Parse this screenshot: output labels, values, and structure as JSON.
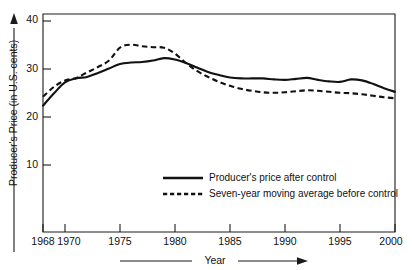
{
  "chart_data": {
    "type": "line",
    "title": "",
    "xlabel": "Year",
    "ylabel": "Producer's Price (in U.S. cents)",
    "xlim": [
      1968,
      2000
    ],
    "ylim": [
      -4,
      40
    ],
    "grid": false,
    "legend_position": "center",
    "x_ticks": [
      1968,
      1970,
      1975,
      1980,
      1985,
      1990,
      1995,
      2000
    ],
    "x_tick_labels": [
      "1968",
      "1970",
      "1975",
      "1980",
      "1985",
      "1990",
      "1995",
      "2000"
    ],
    "y_ticks": [
      10,
      20,
      30,
      40
    ],
    "y_tick_labels": [
      "10",
      "20",
      "30",
      "40"
    ],
    "x": [
      1968,
      1969,
      1970,
      1971,
      1972,
      1973,
      1974,
      1975,
      1976,
      1977,
      1978,
      1979,
      1980,
      1981,
      1982,
      1983,
      1984,
      1985,
      1986,
      1987,
      1988,
      1989,
      1990,
      1991,
      1992,
      1993,
      1994,
      1995,
      1996,
      1997,
      1998,
      1999,
      2000
    ],
    "series": [
      {
        "name": "Producer's price after control",
        "style": "solid",
        "color": "#111111",
        "values": [
          21.5,
          24.0,
          26.2,
          27.0,
          27.3,
          28.1,
          29.0,
          29.9,
          30.2,
          30.3,
          30.6,
          31.1,
          30.8,
          30.1,
          29.2,
          28.3,
          27.7,
          27.2,
          27.0,
          27.0,
          27.0,
          26.8,
          26.7,
          26.9,
          27.1,
          26.7,
          26.4,
          26.3,
          26.8,
          26.6,
          25.9,
          25.0,
          24.3
        ]
      },
      {
        "name": "Seven-year moving average before control",
        "style": "dashed",
        "color": "#111111",
        "values": [
          23.3,
          25.3,
          26.6,
          27.1,
          28.2,
          29.3,
          30.6,
          33.2,
          33.8,
          33.5,
          33.3,
          33.2,
          32.0,
          30.1,
          28.5,
          27.3,
          26.3,
          25.5,
          24.9,
          24.5,
          24.2,
          24.1,
          24.2,
          24.4,
          24.6,
          24.5,
          24.3,
          24.1,
          24.0,
          23.8,
          23.5,
          23.2,
          23.0
        ]
      }
    ]
  },
  "axes": {
    "y_axis_title": "Producer's Price (in U.S. cents)",
    "x_axis_title": "Year"
  },
  "legend": {
    "items": [
      {
        "label": "Producer's price after control",
        "style": "solid"
      },
      {
        "label": "Seven-year moving average before control",
        "style": "dashed"
      }
    ]
  },
  "icons": {
    "y_axis_arrow": "arrow-up-icon",
    "x_axis_arrow": "arrow-right-icon"
  }
}
